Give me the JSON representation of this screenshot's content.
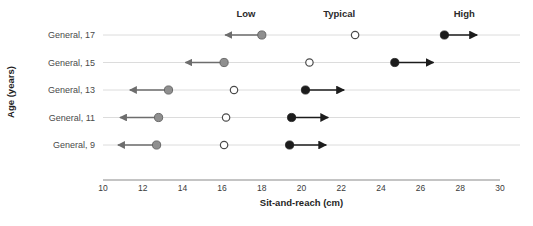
{
  "chart_data": {
    "type": "scatter",
    "title": "",
    "xlabel": "Sit-and-reach (cm)",
    "ylabel": "Age (years)",
    "xlim": [
      10,
      30
    ],
    "xticks": [
      10,
      12,
      14,
      16,
      18,
      20,
      22,
      24,
      26,
      28,
      30
    ],
    "xtick_labels": [
      "10",
      "12",
      "14",
      "16",
      "18",
      "20",
      "22",
      "24",
      "26",
      "28",
      "30"
    ],
    "grid": true,
    "legend_position": "top",
    "column_headers": [
      {
        "label": "Low",
        "x": 17.2
      },
      {
        "label": "Typical",
        "x": 21.9
      },
      {
        "label": "High",
        "x": 28.2
      }
    ],
    "categories": [
      "General, 17",
      "General, 15",
      "General, 13",
      "General, 11",
      "General, 9"
    ],
    "series": [
      {
        "name": "Low",
        "marker": "filled-gray-circle",
        "color": "#8f8f8f",
        "arrow": "left",
        "values": [
          18.0,
          16.1,
          13.3,
          12.8,
          12.7
        ]
      },
      {
        "name": "Typical",
        "marker": "open-circle",
        "color": "#ffffff",
        "arrow": "none",
        "values": [
          22.7,
          20.4,
          16.6,
          16.2,
          16.1
        ]
      },
      {
        "name": "High",
        "marker": "filled-black-circle",
        "color": "#1c1c1c",
        "arrow": "right",
        "values": [
          27.2,
          24.7,
          20.2,
          19.5,
          19.4
        ]
      }
    ],
    "arrow_lengths": {
      "low_extent": 2.1,
      "high_extent": 2.1
    },
    "rows": [
      {
        "label": "General, 17",
        "low": 18.0,
        "typical": 22.7,
        "high": 27.2,
        "low_arrow_end": 15.9,
        "high_arrow_end": 29.1
      },
      {
        "label": "General, 15",
        "low": 16.1,
        "typical": 20.4,
        "high": 24.7,
        "low_arrow_end": 13.9,
        "high_arrow_end": 26.9
      },
      {
        "label": "General, 13",
        "low": 13.3,
        "typical": 16.6,
        "high": 20.2,
        "low_arrow_end": 11.1,
        "high_arrow_end": 22.4
      },
      {
        "label": "General, 11",
        "low": 12.8,
        "typical": 16.2,
        "high": 19.5,
        "low_arrow_end": 10.6,
        "high_arrow_end": 21.6
      },
      {
        "label": "General, 9",
        "low": 12.7,
        "typical": 16.1,
        "high": 19.4,
        "low_arrow_end": 10.5,
        "high_arrow_end": 21.5
      }
    ]
  },
  "colors": {
    "low_marker": "#8f8f8f",
    "low_arrow": "#6d6d6d",
    "typical_marker_fill": "#ffffff",
    "typical_marker_stroke": "#4a4a4a",
    "high_marker": "#1c1c1c",
    "high_arrow": "#1c1c1c",
    "gridline": "#d8d8d8",
    "axis": "#8a8a8a",
    "text": "#3a3a3a"
  }
}
